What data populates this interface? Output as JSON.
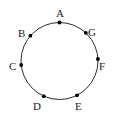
{
  "figure": {
    "type": "circle-point-diagram",
    "background_color": "#ffffff",
    "stroke_color": "#2b2b2b",
    "point_color": "#000000",
    "label_color": "#1a1a1a",
    "circle": {
      "center_x": 59.5,
      "center_y": 61,
      "radius": 38.5,
      "stroke_width": 1
    },
    "point_radius": 1.9
  },
  "points": [
    {
      "id": "A",
      "label": "A",
      "angle_deg": 90,
      "dot_x": 59.5,
      "dot_y": 22.5,
      "label_x": 56,
      "label_y": 8
    },
    {
      "id": "B",
      "label": "B",
      "angle_deg": 139,
      "dot_x": 30.4,
      "dot_y": 35.7,
      "label_x": 18,
      "label_y": 28
    },
    {
      "id": "C",
      "label": "C",
      "angle_deg": 186,
      "dot_x": 21.2,
      "dot_y": 65,
      "label_x": 9,
      "label_y": 61
    },
    {
      "id": "D",
      "label": "D",
      "angle_deg": 246,
      "dot_x": 43.8,
      "dot_y": 96.2,
      "label_x": 33,
      "label_y": 101
    },
    {
      "id": "E",
      "label": "E",
      "angle_deg": 297,
      "dot_x": 77,
      "dot_y": 95.3,
      "label_x": 75,
      "label_y": 101
    },
    {
      "id": "F",
      "label": "F",
      "angle_deg": 3,
      "dot_x": 97.9,
      "dot_y": 59,
      "label_x": 99,
      "label_y": 61
    },
    {
      "id": "G",
      "label": "G",
      "angle_deg": 47,
      "dot_x": 85.8,
      "dot_y": 32.8,
      "label_x": 88,
      "label_y": 27
    }
  ]
}
